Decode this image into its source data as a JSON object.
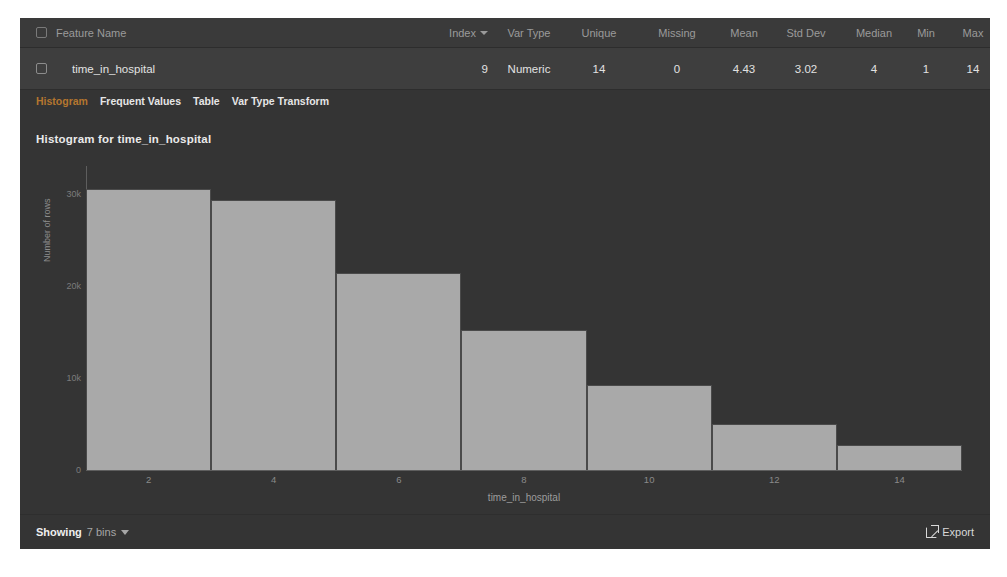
{
  "table": {
    "columns": [
      {
        "key": "name",
        "label": "Feature Name"
      },
      {
        "key": "index",
        "label": "Index",
        "sortable": true,
        "sort_icon": "chevron-down-icon"
      },
      {
        "key": "vartype",
        "label": "Var Type"
      },
      {
        "key": "unique",
        "label": "Unique"
      },
      {
        "key": "missing",
        "label": "Missing"
      },
      {
        "key": "mean",
        "label": "Mean"
      },
      {
        "key": "stddev",
        "label": "Std Dev"
      },
      {
        "key": "median",
        "label": "Median"
      },
      {
        "key": "min",
        "label": "Min"
      },
      {
        "key": "max",
        "label": "Max"
      }
    ],
    "row": {
      "name": "time_in_hospital",
      "index": "9",
      "vartype": "Numeric",
      "unique": "14",
      "missing": "0",
      "mean": "4.43",
      "stddev": "3.02",
      "median": "4",
      "min": "1",
      "max": "14"
    }
  },
  "tabs": [
    {
      "label": "Histogram",
      "active": true
    },
    {
      "label": "Frequent Values",
      "active": false
    },
    {
      "label": "Table",
      "active": false
    },
    {
      "label": "Var Type Transform",
      "active": false
    }
  ],
  "footer": {
    "showing_label": "Showing",
    "bins_value": "7 bins",
    "export_label": "Export",
    "export_icon": "external-link-icon"
  },
  "colors": {
    "panel_bg": "#343434",
    "header_bg": "#3a3a3a",
    "row_bg": "#3e3e3e",
    "bar_fill": "#a9a9a9",
    "bar_stroke": "#4a4a4a",
    "active_tab": "#b4762f",
    "axis": "#5e5e5e"
  },
  "chart_data": {
    "type": "bar",
    "title": "Histogram for time_in_hospital",
    "xlabel": "time_in_hospital",
    "ylabel": "Number of rows",
    "grid": false,
    "legend": null,
    "bins": 7,
    "bin_edges": [
      1,
      3,
      5,
      7,
      9,
      11,
      13,
      15
    ],
    "categories": [
      "1-3",
      "3-5",
      "5-7",
      "7-9",
      "9-11",
      "11-13",
      "13-15"
    ],
    "values": [
      30500,
      29300,
      21400,
      15200,
      9200,
      5000,
      2700
    ],
    "xticks": [
      2,
      4,
      6,
      8,
      10,
      12,
      14
    ],
    "yticks": [
      0,
      10000,
      20000,
      30000
    ],
    "ytick_labels": [
      "0",
      "10k",
      "20k",
      "30k"
    ],
    "xlim": [
      1,
      15
    ],
    "ylim": [
      0,
      33000
    ]
  }
}
